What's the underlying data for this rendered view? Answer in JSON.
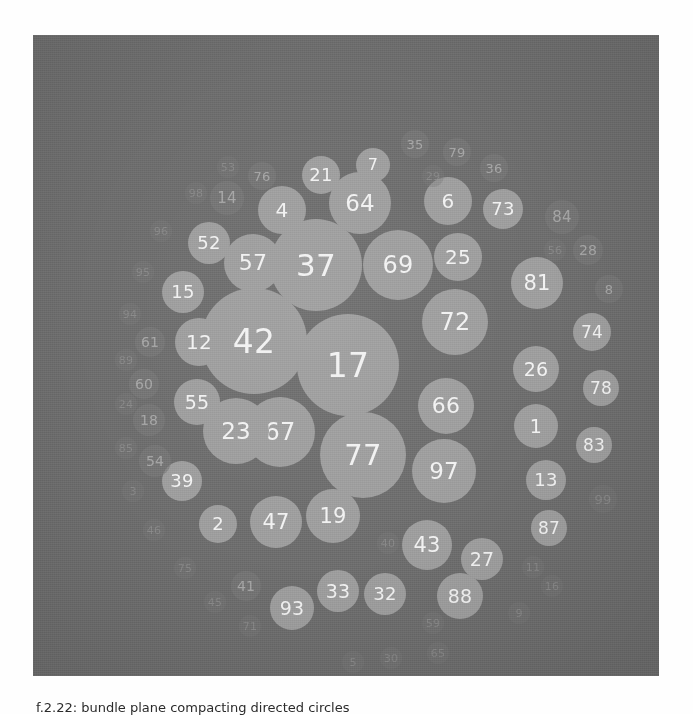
{
  "figure": {
    "kind": "bubble-pack",
    "background_color": "#6e6e6e",
    "bubble_fill_light": "#9e9e9e",
    "bubble_fill_dark": "#7a7a7a",
    "label_color": "#f2f2f2",
    "panel": {
      "left": 33,
      "top": 35,
      "width": 626,
      "height": 641
    }
  },
  "caption": {
    "line": "f.2.22: bundle plane compacting directed circles"
  },
  "chart_data": {
    "type": "bubble",
    "title": "",
    "xlabel": "",
    "ylabel": "",
    "grid": false,
    "legend": "none",
    "note": "Circle-packing layout: each circle is labelled with its id; radius encodes the value. Largest circles sit at the centre, smallest fade into the background at the rim.",
    "x_range": [
      0,
      626
    ],
    "y_range": [
      0,
      641
    ],
    "points": [
      {
        "label": "42",
        "x": 221,
        "y": 306,
        "r": 53,
        "shade": "light",
        "font": 33,
        "dim": "none"
      },
      {
        "label": "17",
        "x": 315,
        "y": 330,
        "r": 51,
        "shade": "light",
        "font": 33,
        "dim": "none"
      },
      {
        "label": "37",
        "x": 283,
        "y": 230,
        "r": 46,
        "shade": "light",
        "font": 31,
        "dim": "none"
      },
      {
        "label": "77",
        "x": 330,
        "y": 420,
        "r": 43,
        "shade": "light",
        "font": 29,
        "dim": "none"
      },
      {
        "label": "67",
        "x": 247,
        "y": 397,
        "r": 35,
        "shade": "light",
        "font": 24,
        "dim": "none"
      },
      {
        "label": "69",
        "x": 365,
        "y": 230,
        "r": 35,
        "shade": "light",
        "font": 24,
        "dim": "none"
      },
      {
        "label": "72",
        "x": 422,
        "y": 287,
        "r": 33,
        "shade": "light",
        "font": 24,
        "dim": "none"
      },
      {
        "label": "23",
        "x": 203,
        "y": 396,
        "r": 33,
        "shade": "light",
        "font": 23,
        "dim": "none"
      },
      {
        "label": "97",
        "x": 411,
        "y": 436,
        "r": 32,
        "shade": "light",
        "font": 23,
        "dim": "none"
      },
      {
        "label": "64",
        "x": 327,
        "y": 168,
        "r": 31,
        "shade": "light",
        "font": 23,
        "dim": "none"
      },
      {
        "label": "57",
        "x": 220,
        "y": 228,
        "r": 29,
        "shade": "light",
        "font": 22,
        "dim": "none"
      },
      {
        "label": "66",
        "x": 413,
        "y": 371,
        "r": 28,
        "shade": "light",
        "font": 22,
        "dim": "none"
      },
      {
        "label": "19",
        "x": 300,
        "y": 481,
        "r": 27,
        "shade": "light",
        "font": 21,
        "dim": "none"
      },
      {
        "label": "47",
        "x": 243,
        "y": 487,
        "r": 26,
        "shade": "light",
        "font": 21,
        "dim": "none"
      },
      {
        "label": "81",
        "x": 504,
        "y": 248,
        "r": 26,
        "shade": "light",
        "font": 21,
        "dim": "none"
      },
      {
        "label": "43",
        "x": 394,
        "y": 510,
        "r": 25,
        "shade": "light",
        "font": 21,
        "dim": "none"
      },
      {
        "label": "25",
        "x": 425,
        "y": 222,
        "r": 24,
        "shade": "light",
        "font": 20,
        "dim": "none"
      },
      {
        "label": "6",
        "x": 415,
        "y": 166,
        "r": 24,
        "shade": "light",
        "font": 20,
        "dim": "none"
      },
      {
        "label": "4",
        "x": 249,
        "y": 175,
        "r": 24,
        "shade": "light",
        "font": 20,
        "dim": "none"
      },
      {
        "label": "12",
        "x": 166,
        "y": 307,
        "r": 24,
        "shade": "light",
        "font": 20,
        "dim": "none"
      },
      {
        "label": "26",
        "x": 503,
        "y": 334,
        "r": 23,
        "shade": "light",
        "font": 19,
        "dim": "none"
      },
      {
        "label": "55",
        "x": 164,
        "y": 367,
        "r": 23,
        "shade": "light",
        "font": 19,
        "dim": "none"
      },
      {
        "label": "88",
        "x": 427,
        "y": 561,
        "r": 23,
        "shade": "light",
        "font": 19,
        "dim": "none"
      },
      {
        "label": "93",
        "x": 259,
        "y": 573,
        "r": 22,
        "shade": "light",
        "font": 19,
        "dim": "none"
      },
      {
        "label": "1",
        "x": 503,
        "y": 391,
        "r": 22,
        "shade": "light",
        "font": 19,
        "dim": "none"
      },
      {
        "label": "33",
        "x": 305,
        "y": 556,
        "r": 21,
        "shade": "light",
        "font": 19,
        "dim": "none"
      },
      {
        "label": "27",
        "x": 449,
        "y": 524,
        "r": 21,
        "shade": "light",
        "font": 19,
        "dim": "none"
      },
      {
        "label": "52",
        "x": 176,
        "y": 208,
        "r": 21,
        "shade": "light",
        "font": 18,
        "dim": "none"
      },
      {
        "label": "15",
        "x": 150,
        "y": 257,
        "r": 21,
        "shade": "light",
        "font": 18,
        "dim": "none"
      },
      {
        "label": "32",
        "x": 352,
        "y": 559,
        "r": 21,
        "shade": "light",
        "font": 18,
        "dim": "none"
      },
      {
        "label": "73",
        "x": 470,
        "y": 174,
        "r": 20,
        "shade": "light",
        "font": 18,
        "dim": "none"
      },
      {
        "label": "13",
        "x": 513,
        "y": 445,
        "r": 20,
        "shade": "light",
        "font": 18,
        "dim": "none"
      },
      {
        "label": "39",
        "x": 149,
        "y": 446,
        "r": 20,
        "shade": "light",
        "font": 18,
        "dim": "none"
      },
      {
        "label": "2",
        "x": 185,
        "y": 489,
        "r": 19,
        "shade": "light",
        "font": 18,
        "dim": "none"
      },
      {
        "label": "21",
        "x": 288,
        "y": 140,
        "r": 19,
        "shade": "light",
        "font": 18,
        "dim": "none"
      },
      {
        "label": "74",
        "x": 559,
        "y": 297,
        "r": 19,
        "shade": "light",
        "font": 17,
        "dim": "none"
      },
      {
        "label": "87",
        "x": 516,
        "y": 493,
        "r": 18,
        "shade": "light",
        "font": 17,
        "dim": "none"
      },
      {
        "label": "78",
        "x": 568,
        "y": 353,
        "r": 18,
        "shade": "light",
        "font": 17,
        "dim": "none"
      },
      {
        "label": "83",
        "x": 561,
        "y": 410,
        "r": 18,
        "shade": "light",
        "font": 17,
        "dim": "none"
      },
      {
        "label": "7",
        "x": 340,
        "y": 130,
        "r": 17,
        "shade": "light",
        "font": 16,
        "dim": "none"
      },
      {
        "label": "84",
        "x": 529,
        "y": 182,
        "r": 17,
        "shade": "dark",
        "font": 15,
        "dim": "dim"
      },
      {
        "label": "14",
        "x": 194,
        "y": 163,
        "r": 17,
        "shade": "dark",
        "font": 15,
        "dim": "dim"
      },
      {
        "label": "54",
        "x": 122,
        "y": 426,
        "r": 16,
        "shade": "dark",
        "font": 14,
        "dim": "dim"
      },
      {
        "label": "18",
        "x": 116,
        "y": 385,
        "r": 16,
        "shade": "dark",
        "font": 14,
        "dim": "dim"
      },
      {
        "label": "60",
        "x": 111,
        "y": 349,
        "r": 15,
        "shade": "dark",
        "font": 14,
        "dim": "dim"
      },
      {
        "label": "61",
        "x": 117,
        "y": 307,
        "r": 15,
        "shade": "dark",
        "font": 14,
        "dim": "dim"
      },
      {
        "label": "28",
        "x": 555,
        "y": 215,
        "r": 15,
        "shade": "dark",
        "font": 14,
        "dim": "dim"
      },
      {
        "label": "8",
        "x": 576,
        "y": 254,
        "r": 14,
        "shade": "dark",
        "font": 13,
        "dim": "dim"
      },
      {
        "label": "41",
        "x": 213,
        "y": 551,
        "r": 15,
        "shade": "dark",
        "font": 14,
        "dim": "dim"
      },
      {
        "label": "36",
        "x": 461,
        "y": 133,
        "r": 14,
        "shade": "dark",
        "font": 13,
        "dim": "dim"
      },
      {
        "label": "79",
        "x": 424,
        "y": 117,
        "r": 14,
        "shade": "dark",
        "font": 13,
        "dim": "dim"
      },
      {
        "label": "35",
        "x": 382,
        "y": 109,
        "r": 14,
        "shade": "dark",
        "font": 13,
        "dim": "dim"
      },
      {
        "label": "76",
        "x": 229,
        "y": 141,
        "r": 14,
        "shade": "dark",
        "font": 13,
        "dim": "dim"
      },
      {
        "label": "99",
        "x": 570,
        "y": 464,
        "r": 14,
        "shade": "dark",
        "font": 13,
        "dim": "faint"
      },
      {
        "label": "56",
        "x": 522,
        "y": 215,
        "r": 11,
        "shade": "dark",
        "font": 11,
        "dim": "faint"
      },
      {
        "label": "53",
        "x": 195,
        "y": 132,
        "r": 11,
        "shade": "dark",
        "font": 11,
        "dim": "faint"
      },
      {
        "label": "98",
        "x": 163,
        "y": 158,
        "r": 11,
        "shade": "dark",
        "font": 11,
        "dim": "faint"
      },
      {
        "label": "96",
        "x": 128,
        "y": 196,
        "r": 11,
        "shade": "dark",
        "font": 11,
        "dim": "faint"
      },
      {
        "label": "95",
        "x": 110,
        "y": 237,
        "r": 11,
        "shade": "dark",
        "font": 11,
        "dim": "faint"
      },
      {
        "label": "94",
        "x": 97,
        "y": 279,
        "r": 11,
        "shade": "dark",
        "font": 11,
        "dim": "faint"
      },
      {
        "label": "89",
        "x": 93,
        "y": 325,
        "r": 11,
        "shade": "dark",
        "font": 11,
        "dim": "faint"
      },
      {
        "label": "24",
        "x": 93,
        "y": 369,
        "r": 11,
        "shade": "dark",
        "font": 11,
        "dim": "faint"
      },
      {
        "label": "85",
        "x": 93,
        "y": 413,
        "r": 11,
        "shade": "dark",
        "font": 11,
        "dim": "faint"
      },
      {
        "label": "3",
        "x": 100,
        "y": 456,
        "r": 11,
        "shade": "dark",
        "font": 11,
        "dim": "faint"
      },
      {
        "label": "46",
        "x": 121,
        "y": 495,
        "r": 11,
        "shade": "dark",
        "font": 11,
        "dim": "faint"
      },
      {
        "label": "75",
        "x": 152,
        "y": 533,
        "r": 11,
        "shade": "dark",
        "font": 11,
        "dim": "faint"
      },
      {
        "label": "45",
        "x": 182,
        "y": 567,
        "r": 11,
        "shade": "dark",
        "font": 11,
        "dim": "faint"
      },
      {
        "label": "71",
        "x": 217,
        "y": 591,
        "r": 11,
        "shade": "dark",
        "font": 11,
        "dim": "faint"
      },
      {
        "label": "29",
        "x": 400,
        "y": 141,
        "r": 11,
        "shade": "dark",
        "font": 11,
        "dim": "faint"
      },
      {
        "label": "40",
        "x": 355,
        "y": 508,
        "r": 11,
        "shade": "dark",
        "font": 11,
        "dim": "faint"
      },
      {
        "label": "11",
        "x": 500,
        "y": 532,
        "r": 11,
        "shade": "dark",
        "font": 11,
        "dim": "faint"
      },
      {
        "label": "16",
        "x": 519,
        "y": 551,
        "r": 11,
        "shade": "dark",
        "font": 11,
        "dim": "faint"
      },
      {
        "label": "9",
        "x": 486,
        "y": 578,
        "r": 11,
        "shade": "dark",
        "font": 11,
        "dim": "faint"
      },
      {
        "label": "59",
        "x": 400,
        "y": 588,
        "r": 11,
        "shade": "dark",
        "font": 11,
        "dim": "faint"
      },
      {
        "label": "65",
        "x": 405,
        "y": 618,
        "r": 11,
        "shade": "dark",
        "font": 11,
        "dim": "faint"
      },
      {
        "label": "30",
        "x": 358,
        "y": 623,
        "r": 11,
        "shade": "dark",
        "font": 11,
        "dim": "faint"
      },
      {
        "label": "5",
        "x": 320,
        "y": 627,
        "r": 11,
        "shade": "dark",
        "font": 11,
        "dim": "faint"
      }
    ]
  }
}
